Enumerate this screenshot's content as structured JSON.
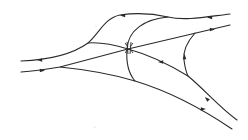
{
  "diagram": {
    "type": "phase-portrait",
    "colors": {
      "stroke": "#2a2a2a",
      "background": "#ffffff"
    },
    "curves": [
      {
        "id": "upper-outer-trajectory",
        "path": "M21,61 C45,60 70,56 88,43 C100,32 105,18 120,15 C140,12 155,14 168,17 C185,21 205,17 230,14"
      },
      {
        "id": "lower-left-straight-trajectory",
        "path": "M21,72 C35,71 48,69 60,67 L128,49 L230,25"
      },
      {
        "id": "inner-left-branch",
        "path": "M88,43 C100,42 115,45 128,49"
      },
      {
        "id": "central-right-descending",
        "path": "M128,49 C150,55 170,65 188,76 C205,90 220,108 237,120"
      },
      {
        "id": "lower-outer-trajectory",
        "path": "M60,67 C90,70 115,75 135,81 C165,90 195,104 232,129"
      },
      {
        "id": "vertical-separatrix",
        "path": "M168,17 C145,19 128,30 127,49 C126,62 129,74 135,81"
      },
      {
        "id": "right-loop",
        "path": "M195,33 C187,42 183,52 184,60 C185,68 186,72 188,76"
      }
    ],
    "arrows": [
      {
        "id": "arrow-upper-left",
        "x": 40,
        "y": 60,
        "direction": "left"
      },
      {
        "id": "arrow-upper-top",
        "x": 123,
        "y": 15.5,
        "direction": "left"
      },
      {
        "id": "arrow-upper-right",
        "x": 210,
        "y": 17.5,
        "direction": "left"
      },
      {
        "id": "arrow-lower-left",
        "x": 42,
        "y": 70.5,
        "direction": "right"
      },
      {
        "id": "arrow-lower-right",
        "x": 212,
        "y": 29.5,
        "direction": "right"
      },
      {
        "id": "arrow-central-descending",
        "x": 161,
        "y": 62,
        "direction": "left"
      },
      {
        "id": "arrow-right-loop",
        "x": 184.5,
        "y": 57,
        "direction": "up"
      },
      {
        "id": "arrow-right-lower-a",
        "x": 207,
        "y": 99,
        "direction": "up-left"
      },
      {
        "id": "arrow-right-lower-b",
        "x": 203,
        "y": 109,
        "direction": "right"
      }
    ],
    "center_marker": {
      "x": 129,
      "y": 48,
      "label": "saddle-crossing"
    },
    "specks": [
      {
        "x": 96,
        "y": 26
      },
      {
        "x": 95,
        "y": 127
      }
    ]
  }
}
